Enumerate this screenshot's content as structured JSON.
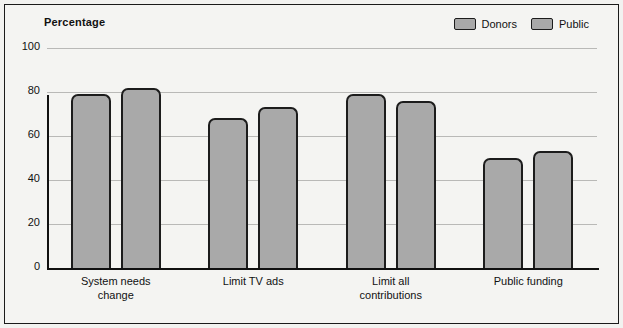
{
  "chart_data": {
    "type": "bar",
    "title": "",
    "ylabel": "Percentage",
    "xlabel": "",
    "ylim": [
      0,
      100
    ],
    "yticks": [
      0,
      20,
      40,
      60,
      80,
      100
    ],
    "grid": true,
    "legend_position": "top-right",
    "categories": [
      "System needs change",
      "Limit TV ads",
      "Limit all contributions",
      "Public funding"
    ],
    "category_lines": [
      [
        "System needs",
        "change"
      ],
      [
        "Limit TV ads",
        ""
      ],
      [
        "Limit all",
        "contributions"
      ],
      [
        "Public funding",
        ""
      ]
    ],
    "series": [
      {
        "name": "Donors",
        "values": [
          79,
          68,
          79,
          50
        ],
        "color": "#a9a9a9"
      },
      {
        "name": "Public",
        "values": [
          82,
          73,
          76,
          53
        ],
        "color": "#a9a9a9"
      }
    ]
  },
  "legend": {
    "items": [
      {
        "label": "Donors"
      },
      {
        "label": "Public"
      }
    ]
  },
  "axis": {
    "title": "Percentage",
    "ticks": [
      "0",
      "20",
      "40",
      "60",
      "80",
      "100"
    ]
  },
  "colors": {
    "bar_fill": "#a9a9a9",
    "bar_stroke": "#1c1c1c",
    "grid": "#b9b9b7",
    "background": "#f4f4f2",
    "text": "#111111"
  }
}
